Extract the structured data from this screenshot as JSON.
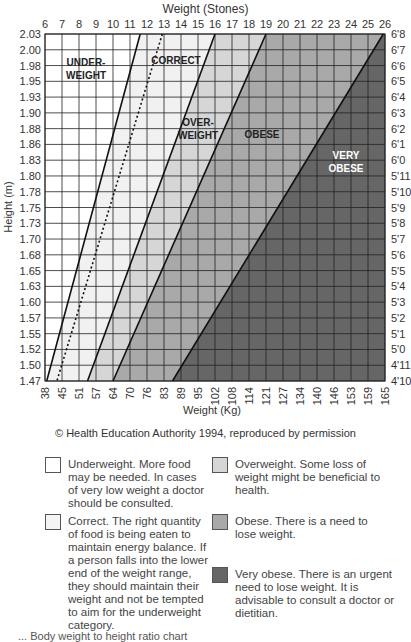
{
  "chart_data": {
    "type": "area",
    "title": "Weight (Stones)",
    "xlabel_top": "Weight (Stones)",
    "xlabel_bottom": "Weight (Kg)",
    "ylabel_left": "Height (m)",
    "top_ticks_stones": [
      "6",
      "7",
      "8",
      "9",
      "10",
      "11",
      "12",
      "13",
      "14",
      "15",
      "16",
      "17",
      "18",
      "19",
      "20",
      "21",
      "22",
      "23",
      "24",
      "25",
      "26"
    ],
    "bottom_ticks_kg": [
      "38",
      "45",
      "51",
      "57",
      "64",
      "70",
      "76",
      "83",
      "89",
      "95",
      "102",
      "108",
      "114",
      "121",
      "127",
      "134",
      "140",
      "146",
      "153",
      "159",
      "165"
    ],
    "left_ticks_m": [
      "2.03",
      "2.00",
      "1.98",
      "1.95",
      "1.93",
      "1.90",
      "1.88",
      "1.86",
      "1.83",
      "1.80",
      "1.78",
      "1.75",
      "1.73",
      "1.70",
      "1.68",
      "1.65",
      "1.63",
      "1.60",
      "1.57",
      "1.55",
      "1.52",
      "1.50",
      "1.47"
    ],
    "right_ticks_ft": [
      "6'8",
      "6'7",
      "6'6",
      "6'5",
      "6'4",
      "6'3",
      "6'2",
      "6'1",
      "6'0",
      "5'11",
      "5'10",
      "5'9",
      "5'8",
      "5'7",
      "5'6",
      "5'5",
      "5'4",
      "5'3",
      "5'2",
      "5'1",
      "5'0",
      "4'11",
      "4'10"
    ],
    "xlim_stones": [
      6,
      26
    ],
    "ylim_m": [
      1.47,
      2.03
    ],
    "grid": true,
    "boundaries": [
      {
        "name": "underweight/correct",
        "style": "solid",
        "top_stones": 11.6,
        "bottom_stones": 6.1
      },
      {
        "name": "correct-midline",
        "style": "dotted",
        "top_stones": 12.9,
        "bottom_stones": 6.7
      },
      {
        "name": "correct/overweight",
        "style": "solid",
        "top_stones": 16.0,
        "bottom_stones": 8.5
      },
      {
        "name": "overweight/obese",
        "style": "solid",
        "top_stones": 19.0,
        "bottom_stones": 10.0
      },
      {
        "name": "obese/very-obese",
        "style": "solid",
        "top_stones": 25.9,
        "bottom_stones": 13.5
      }
    ],
    "zones": [
      {
        "label": "UNDER-\nWEIGHT",
        "color": "#ffffff"
      },
      {
        "label": "CORRECT",
        "color": "#f1f1f1"
      },
      {
        "label": "OVER-\nWEIGHT",
        "color": "#d6d6d6"
      },
      {
        "label": "OBESE",
        "color": "#a9a9a9"
      },
      {
        "label": "VERY\nOBESE",
        "color": "#666666"
      }
    ]
  },
  "zone_labels": {
    "under_1": "UNDER-",
    "under_2": "WEIGHT",
    "correct": "CORRECT",
    "over_1": "OVER-",
    "over_2": "WEIGHT",
    "obese": "OBESE",
    "very_1": "VERY",
    "very_2": "OBESE"
  },
  "header": {
    "title": "Weight (Stones)"
  },
  "axis": {
    "x_bottom_label": "Weight (Kg)",
    "y_left_label": "Height (m)"
  },
  "credit": "© Health Education Authority 1994, reproduced by permission",
  "legend": [
    {
      "key": "underweight",
      "color": "#ffffff",
      "text": "Underweight. More food may be needed. In cases of very low weight a doctor should be consulted."
    },
    {
      "key": "overweight",
      "color": "#d6d6d6",
      "text": "Overweight. Some loss of weight might be beneficial to health."
    },
    {
      "key": "correct",
      "color": "#f4f4f4",
      "text": "Correct. The right quantity of food is being eaten to maintain energy balance. If a person falls into the lower end of the weight range, they should maintain their weight and not be tempted to aim for the underweight category."
    },
    {
      "key": "obese",
      "color": "#a9a9a9",
      "text": "Obese. There is a need to lose weight."
    },
    {
      "key": "very-obese",
      "color": "#666666",
      "text": "Very obese. There is an urgent need to lose weight. It is advisable to consult a doctor or dietitian."
    }
  ],
  "caption": "...  Body weight to height ratio chart"
}
